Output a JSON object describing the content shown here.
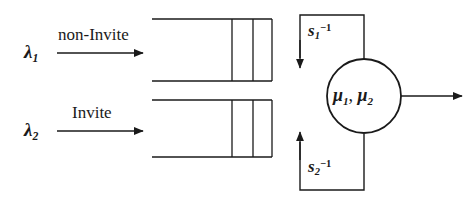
{
  "diagram": {
    "colors": {
      "stroke": "#1a1a1a",
      "text": "#1a1a1a",
      "background": "#ffffff"
    },
    "arrivals": [
      {
        "id": "arrival-1",
        "rate_symbol": "λ",
        "rate_subscript": "1",
        "flow_label": "non-Invite"
      },
      {
        "id": "arrival-2",
        "rate_symbol": "λ",
        "rate_subscript": "2",
        "flow_label": "Invite"
      }
    ],
    "queues": [
      {
        "id": "queue-1",
        "slots": 2
      },
      {
        "id": "queue-2",
        "slots": 2
      }
    ],
    "server": {
      "id": "server",
      "symbol_1": "μ",
      "sub_1": "1",
      "separator": ", ",
      "symbol_2": "μ",
      "sub_2": "2",
      "full_label": "μ1, μ2"
    },
    "feedback": [
      {
        "id": "feedback-1",
        "symbol": "s",
        "subscript": "1",
        "superscript": "−1"
      },
      {
        "id": "feedback-2",
        "symbol": "s",
        "subscript": "2",
        "superscript": "−1"
      }
    ],
    "departure": {
      "id": "departure-arrow",
      "label": ""
    }
  }
}
